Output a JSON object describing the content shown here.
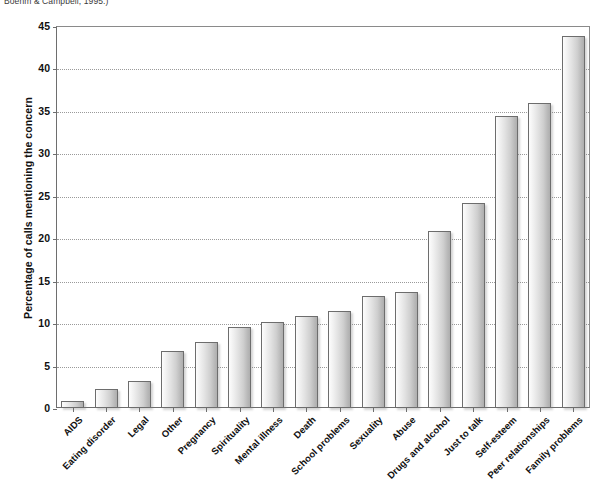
{
  "caption": "Boehm & Campbell, 1995.)",
  "chart_data": {
    "type": "bar",
    "title": "",
    "xlabel": "",
    "ylabel": "Percentage of calls mentioning the concern",
    "ylim": [
      0,
      45
    ],
    "ytick_step": 5,
    "yticks": [
      "0",
      "5",
      "10",
      "15",
      "20",
      "25",
      "30",
      "35",
      "40",
      "45"
    ],
    "grid": "horizontal-dotted",
    "legend": "none",
    "categories": [
      "AIDS",
      "Eating disorder",
      "Legal",
      "Other",
      "Pregnancy",
      "Spirituality",
      "Mental illness",
      "Death",
      "School problems",
      "Sexuality",
      "Abuse",
      "Drugs and alcohol",
      "Just to talk",
      "Self-esteem",
      "Peer relationships",
      "Family problems"
    ],
    "values": [
      0.8,
      2.2,
      3.2,
      6.7,
      7.8,
      9.5,
      10.1,
      10.8,
      11.4,
      13.2,
      13.7,
      20.8,
      24.2,
      34.4,
      35.9,
      43.8
    ]
  },
  "colors": {
    "bar_fill_light": "#fdfdfd",
    "bar_fill_dark": "#aeaeae",
    "bar_border": "#6d6d6d",
    "axis": "#6e6e6e",
    "gridline": "#9a9a9a",
    "text": "#111111"
  }
}
